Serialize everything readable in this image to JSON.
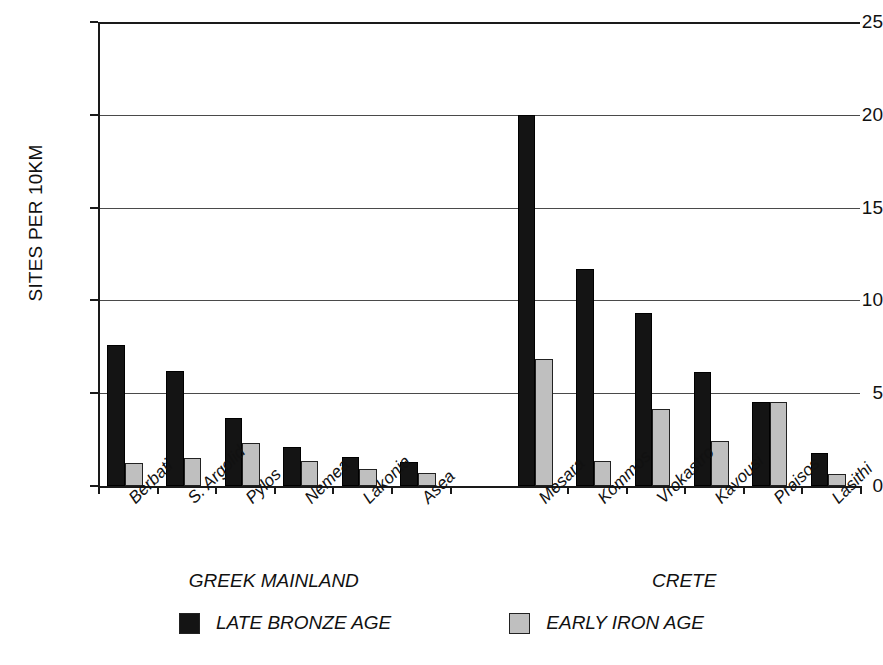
{
  "chart_data": {
    "type": "bar",
    "title": "",
    "xlabel": "",
    "ylabel": "SITES PER 10KM",
    "ylim": [
      0,
      25
    ],
    "yticks": [
      0,
      5,
      10,
      15,
      20,
      25
    ],
    "grid": true,
    "legend_position": "bottom",
    "categories": [
      "Berbati",
      "S. Argolid",
      "Pylos",
      "Nemea",
      "Lakonia",
      "Asea",
      "Mesara",
      "Kommos",
      "Vrokastro",
      "Kavousi",
      "Praisos",
      "Lasithi"
    ],
    "groups": [
      {
        "label": "GREEK MAINLAND",
        "categories": [
          "Berbati",
          "S. Argolid",
          "Pylos",
          "Nemea",
          "Lakonia",
          "Asea"
        ]
      },
      {
        "label": "CRETE",
        "categories": [
          "Mesara",
          "Kommos",
          "Vrokastro",
          "Kavousi",
          "Praisos",
          "Lasithi"
        ]
      }
    ],
    "series": [
      {
        "name": "LATE BRONZE AGE",
        "color": "#141414",
        "values": [
          7.6,
          6.2,
          3.65,
          2.1,
          1.55,
          1.3,
          20.0,
          11.7,
          9.3,
          6.15,
          4.5,
          1.8
        ]
      },
      {
        "name": "EARLY IRON AGE",
        "color": "#bfbfbf",
        "values": [
          1.25,
          1.5,
          2.3,
          1.35,
          0.9,
          0.7,
          6.85,
          1.35,
          4.15,
          2.4,
          4.5,
          0.65
        ]
      }
    ]
  },
  "legend": {
    "items": [
      {
        "label": "LATE BRONZE AGE",
        "swatch": "lba"
      },
      {
        "label": "EARLY IRON AGE",
        "swatch": "eia"
      }
    ]
  }
}
